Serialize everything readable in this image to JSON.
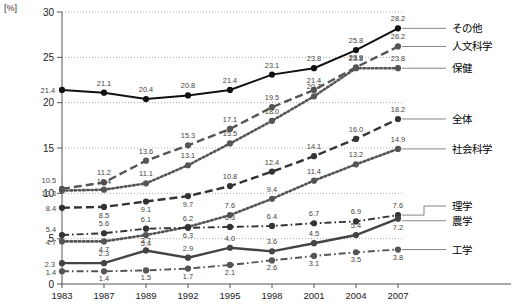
{
  "axis_unit_label": "[%]",
  "legend": {
    "items": [
      {
        "name": "その他",
        "color": "#111111"
      },
      {
        "name": "人文科学",
        "color": "#555555"
      },
      {
        "name": "保健",
        "color": "#555555"
      },
      {
        "name": "全体",
        "color": "#333333"
      },
      {
        "name": "社会科学",
        "color": "#555555"
      },
      {
        "name": "理学",
        "color": "#333333"
      },
      {
        "name": "農学",
        "color": "#444444"
      },
      {
        "name": "工学",
        "color": "#555555"
      }
    ]
  },
  "chart_data": {
    "type": "line",
    "title": "",
    "xlabel": "",
    "ylabel": "[%]",
    "ylim": [
      0,
      30
    ],
    "yticks": [
      0,
      5,
      10,
      15,
      20,
      25,
      30
    ],
    "grid": true,
    "legend_position": "right",
    "categories": [
      "1983",
      "1987",
      "1989",
      "1992",
      "1995",
      "1998",
      "2001",
      "2004",
      "2007"
    ],
    "series": [
      {
        "name": "その他",
        "style": "solid",
        "color": "#111111",
        "values": [
          21.4,
          21.1,
          20.4,
          20.8,
          21.4,
          23.1,
          23.8,
          25.8,
          28.2
        ]
      },
      {
        "name": "人文科学",
        "style": "dashed",
        "color": "#555555",
        "values": [
          10.5,
          11.2,
          13.6,
          15.3,
          17.1,
          19.5,
          21.4,
          23.9,
          26.2
        ]
      },
      {
        "name": "保健",
        "style": "dotted",
        "color": "#555555",
        "values": [
          10.3,
          10.4,
          11.1,
          13.1,
          15.5,
          18.0,
          20.7,
          23.8,
          23.8
        ]
      },
      {
        "name": "全体",
        "style": "dashed",
        "color": "#333333",
        "values": [
          8.4,
          8.5,
          9.1,
          9.7,
          10.8,
          12.4,
          14.1,
          16.0,
          18.2
        ]
      },
      {
        "name": "社会科学",
        "style": "dotted",
        "color": "#555555",
        "values": [
          4.7,
          4.7,
          5.4,
          6.3,
          7.6,
          9.4,
          11.4,
          13.2,
          14.9
        ]
      },
      {
        "name": "理学",
        "style": "dashdot",
        "color": "#333333",
        "values": [
          5.4,
          5.6,
          6.1,
          6.2,
          6.3,
          6.4,
          6.7,
          6.9,
          7.6
        ]
      },
      {
        "name": "農学",
        "style": "solid",
        "color": "#444444",
        "values": [
          2.3,
          2.3,
          3.7,
          2.9,
          4.0,
          3.6,
          4.5,
          5.4,
          7.2
        ]
      },
      {
        "name": "工学",
        "style": "dashdot",
        "color": "#555555",
        "values": [
          1.4,
          1.4,
          1.5,
          1.7,
          2.1,
          2.6,
          3.1,
          3.5,
          3.8
        ]
      }
    ],
    "point_labels": {
      "その他": [
        "21.4",
        "21.1",
        "20.4",
        "20.8",
        "21.4",
        "23.1",
        "23.8",
        "25.8",
        "28.2"
      ],
      "人文科学": [
        "10.5",
        "11.2",
        "13.6",
        "15.3",
        "17.1",
        "19.5",
        "21.4",
        "23.9",
        "26.2"
      ],
      "保健": [
        "10.3",
        "10.4",
        "11.1",
        "13.1",
        "15.5",
        "18.0",
        "20.7",
        "23.8",
        "23.8"
      ],
      "全体": [
        "8.4",
        "8.5",
        "9.1",
        "9.7",
        "10.8",
        "12.4",
        "14.1",
        "16.0",
        "18.2"
      ],
      "社会科学": [
        "4.7",
        "4.7",
        "5.4",
        "6.3",
        "7.6",
        "9.4",
        "11.4",
        "13.2",
        "14.9"
      ],
      "理学": [
        "5.4",
        "5.6",
        "6.1",
        "6.2",
        "6.3",
        "6.4",
        "6.7",
        "6.9",
        "7.6"
      ],
      "農学": [
        "2.3",
        "2.3",
        "3.7",
        "2.9",
        "4.0",
        "3.6",
        "4.5",
        "5.4",
        "7.2"
      ],
      "工学": [
        "1.4",
        "1.4",
        "1.5",
        "1.7",
        "2.1",
        "2.6",
        "3.1",
        "3.5",
        "3.8"
      ]
    }
  }
}
